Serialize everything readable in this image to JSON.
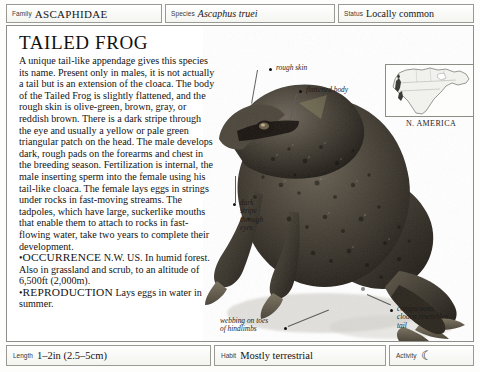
{
  "header": {
    "family": {
      "label": "Family",
      "value": "ASCAPHIDAE"
    },
    "species": {
      "label": "Species",
      "value": "Ascaphus truei"
    },
    "status": {
      "label": "Status",
      "value": "Locally common"
    }
  },
  "article": {
    "title": "TAILED FROG",
    "paragraph": "A unique tail-like appendage gives this species its name. Present only in males, it is not actually a tail but is an extension of the cloaca. The body of the Tailed Frog is slightly flattened, and the rough skin is olive-green, brown, gray, or reddish brown. There is a dark stripe through the eye and usually a yellow or pale green triangular patch on the head. The male develops dark, rough pads on the forearms and chest in the breeding season. Fertilization is internal, the male inserting sperm into the female using his tail-like cloaca. The female lays eggs in strings under rocks in fast-moving streams. The tadpoles, which have large, suckerlike mouths that enable them to attach to rocks in fast-flowing water, take two years to complete their development.",
    "bullets": [
      {
        "marker": "•",
        "heading": "OCCURRENCE",
        "text": " N.W. US. In humid forest. Also in grassland and scrub, to an altitude of 6,500ft (2,000m)."
      },
      {
        "marker": "•",
        "heading": "REPRODUCTION",
        "text": " Lays eggs in water in summer."
      }
    ]
  },
  "map": {
    "caption": "N. AMERICA"
  },
  "callouts": [
    {
      "id": "rough-skin",
      "text": "rough skin"
    },
    {
      "id": "flattened-body",
      "text": "flattened body"
    },
    {
      "id": "dark-stripe",
      "text": "dark\nstripe\nthrough\neyes"
    },
    {
      "id": "conspicuous-cloaca",
      "text": "conspicuous\ncloaca resembles\ntail"
    },
    {
      "id": "webbing-toes",
      "text": "webbing on toes\nof hindlimbs"
    }
  ],
  "footer": {
    "length": {
      "label": "Length",
      "value": "1–2in (2.5–5cm)"
    },
    "habit": {
      "label": "Habit",
      "value": "Mostly terrestrial"
    },
    "activity": {
      "label": "Activity",
      "value": "☾"
    }
  },
  "colors": {
    "border": "#8e8e88",
    "text": "#131313",
    "panel": "#ffffff"
  }
}
